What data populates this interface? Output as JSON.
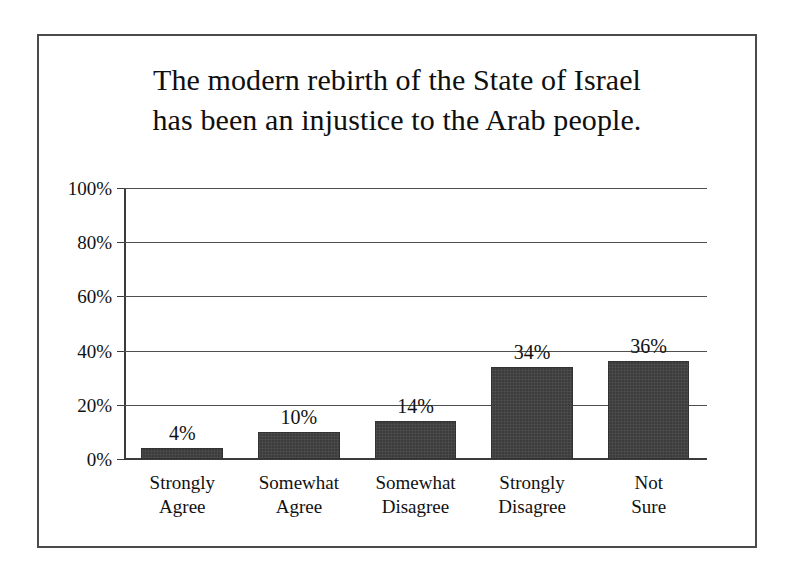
{
  "figure": {
    "title": "The modern rebirth of the State of Israel\nhas been an injustice to the Arab people."
  },
  "chart_data": {
    "type": "bar",
    "title": "The modern rebirth of the State of Israel has been an injustice to the Arab people.",
    "xlabel": "",
    "ylabel": "",
    "categories": [
      "Strongly\nAgree",
      "Somewhat\nAgree",
      "Somewhat\nDisagree",
      "Strongly\nDisagree",
      "Not\nSure"
    ],
    "values": [
      4,
      10,
      14,
      34,
      36
    ],
    "value_labels": [
      "4%",
      "10%",
      "14%",
      "34%",
      "36%"
    ],
    "ylim": [
      0,
      100
    ],
    "ytick_values": [
      0,
      20,
      40,
      60,
      80,
      100
    ],
    "ytick_labels": [
      "0%",
      "20%",
      "40%",
      "60%",
      "80%",
      "100%"
    ],
    "grid": true,
    "legend": false,
    "bar_color": "#3c3c3c",
    "axis_color": "#3b3b3b",
    "frame_color": "#4a4a4a",
    "background": "#ffffff"
  }
}
